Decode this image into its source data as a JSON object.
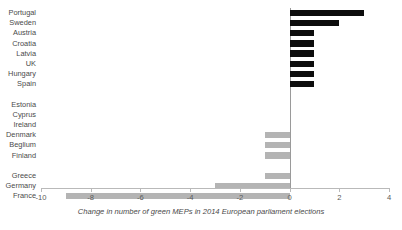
{
  "chart_data": {
    "type": "bar",
    "orientation": "horizontal",
    "title": "",
    "xlabel": "Change in number of green MEPs in 2014 European parliament elections",
    "ylabel": "",
    "xlim": [
      -10,
      4
    ],
    "xticks": [
      -10,
      -8,
      -6,
      -4,
      -2,
      0,
      2,
      4
    ],
    "xtick_labels": [
      "-10",
      "-8",
      "-6",
      "-4",
      "-2",
      "0",
      "2",
      "4"
    ],
    "grid": false,
    "legend": "none",
    "categories": [
      "Portugal",
      "Sweden",
      "Austria",
      "Croatia",
      "Latvia",
      "UK",
      "Hungary",
      "Spain",
      "",
      "Estonia",
      "Cyprus",
      "Ireland",
      "Denmark",
      "Beglium",
      "Finland",
      "",
      "Greece",
      "Germany",
      "France"
    ],
    "values": [
      3,
      2,
      1,
      1,
      1,
      1,
      1,
      1,
      null,
      0,
      0,
      0,
      -1,
      -1,
      -1,
      null,
      -1,
      -3,
      -9
    ],
    "colors": {
      "positive": "#0d0d0d",
      "negative": "#b4b4b4",
      "axis": "#b9b9b9",
      "zero_line": "#9a9a9a",
      "text": "#4a4a4a",
      "background": "#ffffff"
    }
  }
}
